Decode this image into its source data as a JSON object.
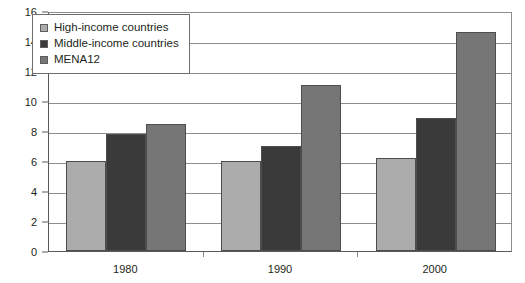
{
  "chart_data": {
    "type": "bar",
    "title": "",
    "subtitle": "",
    "xlabel": "",
    "ylabel": "",
    "categories": [
      "1980",
      "1990",
      "2000"
    ],
    "series": [
      {
        "name": "High-income countries",
        "color": "#acacac",
        "values": [
          6.0,
          6.0,
          6.2
        ]
      },
      {
        "name": "Middle-income countries",
        "color": "#3a3a3a",
        "values": [
          7.8,
          7.0,
          8.9
        ]
      },
      {
        "name": "MENA12",
        "color": "#767676",
        "values": [
          8.5,
          11.1,
          14.6
        ]
      }
    ],
    "ylim": [
      0,
      16
    ],
    "y_ticks": [
      0,
      2,
      4,
      6,
      8,
      10,
      12,
      14,
      16
    ],
    "y_tick_labels": [
      "0",
      "2",
      "4",
      "6",
      "8",
      "10",
      "12",
      "14",
      "16"
    ],
    "grid": true,
    "legend_position": "top-left",
    "annotations": []
  },
  "legend": {
    "entries": [
      {
        "label": "High-income countries",
        "swatch_color": "#acacac"
      },
      {
        "label": "Middle-income countries",
        "swatch_color": "#3a3a3a"
      },
      {
        "label": "MENA12",
        "swatch_color": "#767676"
      }
    ]
  },
  "axis_colors": {
    "gridline": "#8d8d8d",
    "axis_line": "#5a5a5a",
    "text": "#231f20"
  }
}
